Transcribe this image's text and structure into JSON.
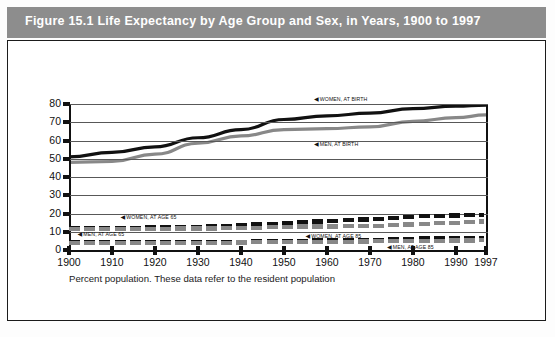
{
  "figure": {
    "header_title": "Figure 15.1  Life Expectancy by Age Group and Sex, in Years, 1900 to 1997",
    "footnote": "Percent population. These data refer to the resident population",
    "header_bg": "#8d8d8d",
    "header_fg": "#ffffff",
    "series_black": "#111111",
    "series_gray": "#888888"
  },
  "chart_data": {
    "type": "line",
    "title": "Life Expectancy by Age Group and Sex, in Years, 1900 to 1997",
    "xlabel": "",
    "ylabel": "",
    "xlim": [
      1900,
      1997
    ],
    "ylim": [
      0,
      80
    ],
    "grid": true,
    "legend_position": "inline-annotations",
    "x": [
      1900,
      1910,
      1920,
      1930,
      1940,
      1950,
      1960,
      1970,
      1980,
      1990,
      1997
    ],
    "yticks": [
      0,
      10,
      20,
      30,
      40,
      50,
      60,
      70,
      80
    ],
    "xticks": [
      1900,
      1910,
      1920,
      1930,
      1940,
      1950,
      1960,
      1970,
      1980,
      1990,
      1997
    ],
    "series": [
      {
        "name": "WOMEN, AT BIRTH",
        "style": "solid",
        "color": "#111111",
        "values": [
          51.0,
          53.5,
          56.5,
          61.5,
          66.0,
          71.5,
          73.5,
          75.0,
          77.5,
          78.8,
          79.4
        ]
      },
      {
        "name": "MEN, AT BIRTH",
        "style": "solid",
        "color": "#888888",
        "values": [
          48.0,
          48.5,
          52.5,
          58.5,
          62.5,
          66.0,
          66.5,
          67.5,
          70.5,
          72.5,
          74.0
        ]
      },
      {
        "name": "WOMEN, AT AGE 65",
        "style": "dashed",
        "color": "#111111",
        "values": [
          12.0,
          12.1,
          12.4,
          12.9,
          13.6,
          15.0,
          15.9,
          17.0,
          18.4,
          19.0,
          19.2
        ]
      },
      {
        "name": "MEN, AT AGE 65",
        "style": "dashed",
        "color": "#888888",
        "values": [
          11.3,
          11.3,
          11.7,
          11.8,
          11.9,
          12.8,
          12.9,
          13.1,
          14.2,
          15.1,
          15.8
        ]
      },
      {
        "name": "WOMEN, AT AGE 85",
        "style": "dashed",
        "color": "#111111",
        "values": [
          4.1,
          4.2,
          4.3,
          4.4,
          4.6,
          5.1,
          5.2,
          5.6,
          6.4,
          6.4,
          6.5
        ]
      },
      {
        "name": "MEN, AT AGE 85",
        "style": "dashed",
        "color": "#888888",
        "values": [
          3.8,
          3.9,
          4.0,
          4.0,
          4.1,
          4.4,
          4.4,
          4.7,
          5.0,
          5.2,
          5.3
        ]
      }
    ],
    "annotations": [
      {
        "text": "WOMEN, AT BIRTH",
        "x": 1957,
        "y": 82.5
      },
      {
        "text": "MEN, AT BIRTH",
        "x": 1957,
        "y": 58.0
      },
      {
        "text": "WOMEN, AT AGE 65",
        "x": 1912,
        "y": 18.0
      },
      {
        "text": "MEN, AT AGE 65",
        "x": 1902,
        "y": 8.5
      },
      {
        "text": "WOMEN, AT AGE 85",
        "x": 1955,
        "y": 7.5
      },
      {
        "text": "MEN, AT AGE 85",
        "x": 1974,
        "y": 1.5
      }
    ]
  },
  "axis": {
    "y_labels": [
      "80",
      "70",
      "60",
      "50",
      "40",
      "30",
      "20",
      "10",
      "0"
    ],
    "x_labels": [
      "1900",
      "1910",
      "1920",
      "1930",
      "1940",
      "1950",
      "1960",
      "1970",
      "1980",
      "1990",
      "1997"
    ]
  }
}
